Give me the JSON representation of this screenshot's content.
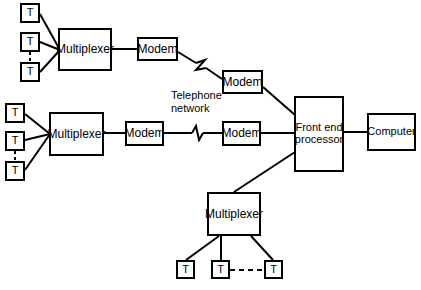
{
  "diagram": {
    "canvas": {
      "width": 421,
      "height": 290,
      "background": "#ffffff"
    },
    "line_color": "#000000",
    "labels": {
      "terminal": "T",
      "multiplexer": "Multiplexer",
      "modem": "Modem",
      "front_end_processor": "Front end\nprocessor",
      "computer": "Computer",
      "telephone_network": "Telephone\nnetwork"
    },
    "nodes": [
      {
        "id": "t-top-1",
        "type": "terminal",
        "label": "T",
        "x": 20,
        "y": 3,
        "w": 20,
        "h": 20
      },
      {
        "id": "t-top-2",
        "type": "terminal",
        "label": "T",
        "x": 20,
        "y": 32,
        "w": 20,
        "h": 20
      },
      {
        "id": "t-top-3",
        "type": "terminal",
        "label": "T",
        "x": 20,
        "y": 62,
        "w": 20,
        "h": 20
      },
      {
        "id": "mux-top",
        "type": "multiplexer",
        "label": "Multiplexer",
        "x": 58,
        "y": 28,
        "w": 54,
        "h": 43
      },
      {
        "id": "modem-top-a",
        "type": "modem",
        "label": "Modem",
        "x": 137,
        "y": 37,
        "w": 41,
        "h": 24
      },
      {
        "id": "modem-top-b",
        "type": "modem",
        "label": "Modem",
        "x": 222,
        "y": 70,
        "w": 41,
        "h": 24
      },
      {
        "id": "t-mid-1",
        "type": "terminal",
        "label": "T",
        "x": 5,
        "y": 103,
        "w": 20,
        "h": 20
      },
      {
        "id": "t-mid-2",
        "type": "terminal",
        "label": "T",
        "x": 5,
        "y": 131,
        "w": 20,
        "h": 20
      },
      {
        "id": "t-mid-3",
        "type": "terminal",
        "label": "T",
        "x": 5,
        "y": 161,
        "w": 20,
        "h": 20
      },
      {
        "id": "mux-mid",
        "type": "multiplexer",
        "label": "Multiplexer",
        "x": 49,
        "y": 112,
        "w": 55,
        "h": 44
      },
      {
        "id": "modem-mid-a",
        "type": "modem",
        "label": "Modem",
        "x": 125,
        "y": 121,
        "w": 39,
        "h": 25
      },
      {
        "id": "modem-mid-b",
        "type": "modem",
        "label": "Modem",
        "x": 222,
        "y": 121,
        "w": 39,
        "h": 25
      },
      {
        "id": "fep",
        "type": "front_end_processor",
        "label": "Front end\nprocessor",
        "x": 294,
        "y": 96,
        "w": 50,
        "h": 76
      },
      {
        "id": "computer",
        "type": "computer",
        "label": "Computer",
        "x": 367,
        "y": 113,
        "w": 49,
        "h": 38
      },
      {
        "id": "mux-bottom",
        "type": "multiplexer",
        "label": "Multiplexer",
        "x": 207,
        "y": 192,
        "w": 54,
        "h": 44
      },
      {
        "id": "t-bot-1",
        "type": "terminal",
        "label": "T",
        "x": 176,
        "y": 260,
        "w": 19,
        "h": 19
      },
      {
        "id": "t-bot-2",
        "type": "terminal",
        "label": "T",
        "x": 211,
        "y": 260,
        "w": 19,
        "h": 19
      },
      {
        "id": "t-bot-3",
        "type": "terminal",
        "label": "T",
        "x": 264,
        "y": 260,
        "w": 19,
        "h": 19
      }
    ],
    "annotations": [
      {
        "id": "telephone-network-label",
        "text": "Telephone\nnetwork",
        "x": 171,
        "y": 89
      }
    ],
    "connections": [
      {
        "from": "t-top-1",
        "to": "mux-top",
        "style": "solid"
      },
      {
        "from": "t-top-2",
        "to": "mux-top",
        "style": "solid"
      },
      {
        "from": "t-top-3",
        "to": "mux-top",
        "style": "solid"
      },
      {
        "from": "t-top-2",
        "to": "t-top-3",
        "style": "dashed"
      },
      {
        "from": "mux-top",
        "to": "modem-top-a",
        "style": "solid"
      },
      {
        "from": "modem-top-a",
        "to": "modem-top-b",
        "style": "lightning"
      },
      {
        "from": "modem-top-b",
        "to": "fep",
        "style": "solid"
      },
      {
        "from": "t-mid-1",
        "to": "mux-mid",
        "style": "solid"
      },
      {
        "from": "t-mid-2",
        "to": "mux-mid",
        "style": "solid"
      },
      {
        "from": "t-mid-3",
        "to": "mux-mid",
        "style": "solid"
      },
      {
        "from": "t-mid-2",
        "to": "t-mid-3",
        "style": "dashed"
      },
      {
        "from": "mux-mid",
        "to": "modem-mid-a",
        "style": "solid"
      },
      {
        "from": "modem-mid-a",
        "to": "modem-mid-b",
        "style": "lightning"
      },
      {
        "from": "modem-mid-b",
        "to": "fep",
        "style": "solid"
      },
      {
        "from": "fep",
        "to": "computer",
        "style": "solid"
      },
      {
        "from": "mux-bottom",
        "to": "fep",
        "style": "solid"
      },
      {
        "from": "mux-bottom",
        "to": "t-bot-1",
        "style": "solid"
      },
      {
        "from": "mux-bottom",
        "to": "t-bot-2",
        "style": "solid"
      },
      {
        "from": "mux-bottom",
        "to": "t-bot-3",
        "style": "solid"
      },
      {
        "from": "t-bot-2",
        "to": "t-bot-3",
        "style": "dashed"
      }
    ]
  }
}
